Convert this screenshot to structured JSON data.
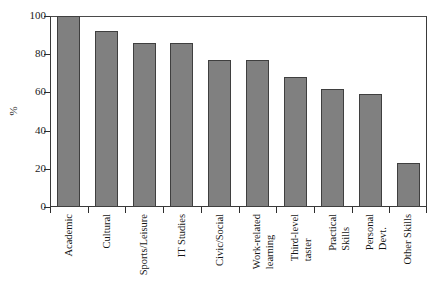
{
  "chart_data": {
    "type": "bar",
    "title": "",
    "subtitle": "",
    "xlabel": "",
    "ylabel": "%",
    "ylim": [
      0,
      100
    ],
    "yticks": [
      0,
      20,
      40,
      60,
      80,
      100
    ],
    "grid": false,
    "legend": null,
    "orientation": "vertical",
    "bar_color": "#808080",
    "bar_edge_color": "#3f3f3f",
    "frame_color": "#3a3a3a",
    "categories": [
      "Academic",
      "Cultural",
      "Sports/Leisure",
      "IT Studies",
      "Civic/Social",
      "Work-related learning",
      "Third-level taster",
      "Practical Skills",
      "Personal Devt.",
      "Other Skills"
    ],
    "category_lines": [
      [
        "Academic"
      ],
      [
        "Cultural"
      ],
      [
        "Sports/Leisure"
      ],
      [
        "IT Studies"
      ],
      [
        "Civic/Social"
      ],
      [
        "Work-related",
        "learning"
      ],
      [
        "Third-level",
        "taster"
      ],
      [
        "Practical",
        "Skills"
      ],
      [
        "Personal",
        "Devt."
      ],
      [
        "Other Skills"
      ]
    ],
    "values": [
      100,
      92,
      86,
      86,
      77,
      77,
      68,
      62,
      59,
      23
    ]
  }
}
